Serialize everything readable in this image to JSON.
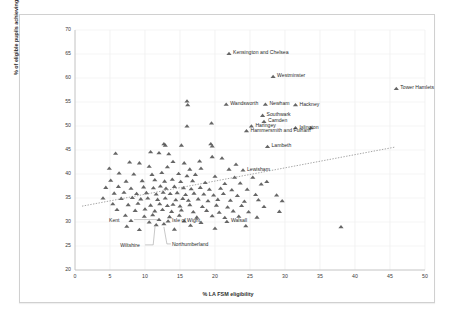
{
  "chart_data": {
    "type": "scatter",
    "title": "",
    "xlabel": "% LA FSM eligibility",
    "ylabel": "% of eligible pupils achieving level 5+ A*–C including English and maths",
    "xlim": [
      0,
      50
    ],
    "ylim": [
      20,
      70
    ],
    "xticks": [
      0,
      5,
      10,
      15,
      20,
      25,
      30,
      35,
      40,
      45,
      50
    ],
    "yticks": [
      20,
      25,
      30,
      35,
      40,
      45,
      50,
      55,
      60,
      65,
      70
    ],
    "grid": true,
    "legend": "none",
    "marker": "triangle",
    "marker_color": "#595959",
    "trendline": {
      "show": true,
      "style": "dotted",
      "color": "#808080",
      "x0": 1.0,
      "y0": 33.3,
      "x1": 45.7,
      "y1": 45.6
    },
    "annotations": [
      {
        "label": "Kensington and Chelsea",
        "x": 22.0,
        "y": 65.1
      },
      {
        "label": "Westminster",
        "x": 28.3,
        "y": 60.3
      },
      {
        "label": "Tower Hamlets",
        "x": 45.9,
        "y": 57.8
      },
      {
        "label": "Wandsworth",
        "x": 21.6,
        "y": 54.5
      },
      {
        "label": "Newham",
        "x": 27.2,
        "y": 54.5
      },
      {
        "label": "Hackney",
        "x": 31.5,
        "y": 54.4
      },
      {
        "label": "Southwark",
        "x": 26.8,
        "y": 52.2
      },
      {
        "label": "Camden",
        "x": 27.0,
        "y": 50.9
      },
      {
        "label": "Haringey",
        "x": 25.2,
        "y": 50.0
      },
      {
        "label": "Islington",
        "x": 31.5,
        "y": 49.6
      },
      {
        "label": "Hammersmith and Fulham",
        "x": 24.5,
        "y": 49.0
      },
      {
        "label": "Lambeth",
        "x": 27.5,
        "y": 45.7
      },
      {
        "label": "Lewisham",
        "x": 24.0,
        "y": 40.8
      },
      {
        "label": "Kent",
        "x": 12.0,
        "y": 30.5
      },
      {
        "label": "Isle of Wight",
        "x": 13.3,
        "y": 30.2
      },
      {
        "label": "Walsall",
        "x": 21.7,
        "y": 30.1
      },
      {
        "label": "Wiltshire",
        "x": 11.6,
        "y": 29.4
      },
      {
        "label": "Northumberland",
        "x": 12.7,
        "y": 29.6
      }
    ],
    "points": [
      [
        22.0,
        65.1
      ],
      [
        28.3,
        60.3
      ],
      [
        45.9,
        57.8
      ],
      [
        16.0,
        55.2
      ],
      [
        16.1,
        54.4
      ],
      [
        21.6,
        54.5
      ],
      [
        27.2,
        54.5
      ],
      [
        31.5,
        54.4
      ],
      [
        26.8,
        52.2
      ],
      [
        27.0,
        50.9
      ],
      [
        16.0,
        50.0
      ],
      [
        19.5,
        50.6
      ],
      [
        33.7,
        49.6
      ],
      [
        25.2,
        50.0
      ],
      [
        31.5,
        49.6
      ],
      [
        24.5,
        49.0
      ],
      [
        12.7,
        46.3
      ],
      [
        12.9,
        46.0
      ],
      [
        15.2,
        46.0
      ],
      [
        19.4,
        46.3
      ],
      [
        19.6,
        45.8
      ],
      [
        27.5,
        45.7
      ],
      [
        5.8,
        44.3
      ],
      [
        10.8,
        44.6
      ],
      [
        12.0,
        44.4
      ],
      [
        13.4,
        44.2
      ],
      [
        19.6,
        43.6
      ],
      [
        21.0,
        43.3
      ],
      [
        7.8,
        42.5
      ],
      [
        9.2,
        42.3
      ],
      [
        14.0,
        42.6
      ],
      [
        15.6,
        42.3
      ],
      [
        17.8,
        42.7
      ],
      [
        23.0,
        42.0
      ],
      [
        4.9,
        41.2
      ],
      [
        10.6,
        41.6
      ],
      [
        13.2,
        41.5
      ],
      [
        16.4,
        41.0
      ],
      [
        18.0,
        41.2
      ],
      [
        22.0,
        41.0
      ],
      [
        24.0,
        40.8
      ],
      [
        6.3,
        40.2
      ],
      [
        8.4,
        40.0
      ],
      [
        11.0,
        39.9
      ],
      [
        12.4,
        40.3
      ],
      [
        14.8,
        40.1
      ],
      [
        16.0,
        39.6
      ],
      [
        17.2,
        39.9
      ],
      [
        20.0,
        39.5
      ],
      [
        22.8,
        39.3
      ],
      [
        25.4,
        39.3
      ],
      [
        5.1,
        38.7
      ],
      [
        7.3,
        38.5
      ],
      [
        9.6,
        38.6
      ],
      [
        11.4,
        38.8
      ],
      [
        12.8,
        38.5
      ],
      [
        13.9,
        38.9
      ],
      [
        15.1,
        38.4
      ],
      [
        16.8,
        38.6
      ],
      [
        18.6,
        38.2
      ],
      [
        21.4,
        38.0
      ],
      [
        23.6,
        38.1
      ],
      [
        26.6,
        37.9
      ],
      [
        27.4,
        38.4
      ],
      [
        4.4,
        37.2
      ],
      [
        6.2,
        37.4
      ],
      [
        8.0,
        37.0
      ],
      [
        9.8,
        37.3
      ],
      [
        11.2,
        37.1
      ],
      [
        12.2,
        37.5
      ],
      [
        13.0,
        37.0
      ],
      [
        14.2,
        37.4
      ],
      [
        15.5,
        37.1
      ],
      [
        16.6,
        36.9
      ],
      [
        17.9,
        37.2
      ],
      [
        19.2,
        36.8
      ],
      [
        20.8,
        37.0
      ],
      [
        22.4,
        36.7
      ],
      [
        24.6,
        36.8
      ],
      [
        5.6,
        36.0
      ],
      [
        7.0,
        36.2
      ],
      [
        8.8,
        35.9
      ],
      [
        10.2,
        36.1
      ],
      [
        11.6,
        35.8
      ],
      [
        12.6,
        36.2
      ],
      [
        13.6,
        35.9
      ],
      [
        14.6,
        36.1
      ],
      [
        15.8,
        35.7
      ],
      [
        17.0,
        36.0
      ],
      [
        18.4,
        35.8
      ],
      [
        19.8,
        35.6
      ],
      [
        21.2,
        35.9
      ],
      [
        23.2,
        35.5
      ],
      [
        25.8,
        35.7
      ],
      [
        28.8,
        35.6
      ],
      [
        4.0,
        35.0
      ],
      [
        6.6,
        34.9
      ],
      [
        8.2,
        35.1
      ],
      [
        9.4,
        34.8
      ],
      [
        10.4,
        35.0
      ],
      [
        11.8,
        34.7
      ],
      [
        12.9,
        35.0
      ],
      [
        14.4,
        34.6
      ],
      [
        15.4,
        34.9
      ],
      [
        16.2,
        34.5
      ],
      [
        17.6,
        34.8
      ],
      [
        19.0,
        34.4
      ],
      [
        20.4,
        34.7
      ],
      [
        22.2,
        34.5
      ],
      [
        24.2,
        34.3
      ],
      [
        26.2,
        34.6
      ],
      [
        29.6,
        34.4
      ],
      [
        5.4,
        33.8
      ],
      [
        7.6,
        33.6
      ],
      [
        9.0,
        33.9
      ],
      [
        10.8,
        33.5
      ],
      [
        12.1,
        33.8
      ],
      [
        13.2,
        33.4
      ],
      [
        14.0,
        33.7
      ],
      [
        15.0,
        33.3
      ],
      [
        16.4,
        33.6
      ],
      [
        18.2,
        33.2
      ],
      [
        20.2,
        33.5
      ],
      [
        21.8,
        33.1
      ],
      [
        23.8,
        33.4
      ],
      [
        27.0,
        33.2
      ],
      [
        6.0,
        32.6
      ],
      [
        8.6,
        32.4
      ],
      [
        10.0,
        32.7
      ],
      [
        11.4,
        32.3
      ],
      [
        12.5,
        32.6
      ],
      [
        13.8,
        32.2
      ],
      [
        15.2,
        32.5
      ],
      [
        16.9,
        32.1
      ],
      [
        18.8,
        32.4
      ],
      [
        20.6,
        32.0
      ],
      [
        22.6,
        32.3
      ],
      [
        24.8,
        32.1
      ],
      [
        29.2,
        32.2
      ],
      [
        7.2,
        31.4
      ],
      [
        9.9,
        31.2
      ],
      [
        11.1,
        31.5
      ],
      [
        13.5,
        31.1
      ],
      [
        14.9,
        31.4
      ],
      [
        17.4,
        31.0
      ],
      [
        19.6,
        31.3
      ],
      [
        21.4,
        30.9
      ],
      [
        23.4,
        31.2
      ],
      [
        26.0,
        31.0
      ],
      [
        12.0,
        30.5
      ],
      [
        13.3,
        30.2
      ],
      [
        21.7,
        30.1
      ],
      [
        8.0,
        30.3
      ],
      [
        10.6,
        30.0
      ],
      [
        15.6,
        30.2
      ],
      [
        18.0,
        29.9
      ],
      [
        11.6,
        29.4
      ],
      [
        12.7,
        29.6
      ],
      [
        7.4,
        29.1
      ],
      [
        16.5,
        29.3
      ],
      [
        24.4,
        29.2
      ],
      [
        38.0,
        29.0
      ],
      [
        20.0,
        28.7
      ],
      [
        14.2,
        28.5
      ],
      [
        9.2,
        28.4
      ]
    ]
  }
}
